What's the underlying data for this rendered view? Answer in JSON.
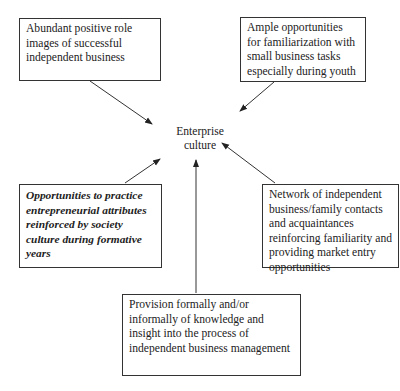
{
  "diagram": {
    "center": {
      "line1": "Enterprise",
      "line2": "culture"
    },
    "boxes": [
      {
        "id": "role-images",
        "text": "Abundant positive role images of successful independent business",
        "style": "normal"
      },
      {
        "id": "familiarization",
        "text": "Ample opportunities for familiarization with small business tasks especially during youth",
        "style": "normal"
      },
      {
        "id": "practice-opportunities",
        "text": "Opportunities to practice entrepreneurial attributes reinforced by society culture during formative years",
        "style": "bold-italic"
      },
      {
        "id": "network",
        "text": "Network of independent business/family contacts and acquaintances reinforcing familiarity and providing market entry opportunities",
        "style": "normal"
      },
      {
        "id": "knowledge-provision",
        "text": "Provision formally and/or informally of knowledge and insight into the process of independent business management",
        "style": "normal"
      }
    ],
    "arrows": [
      {
        "from": "role-images",
        "to": "center"
      },
      {
        "from": "familiarization",
        "to": "center"
      },
      {
        "from": "practice-opportunities",
        "to": "center"
      },
      {
        "from": "network",
        "to": "center"
      },
      {
        "from": "knowledge-provision",
        "to": "center"
      }
    ],
    "colors": {
      "stroke": "#333333",
      "background": "#ffffff",
      "text": "#222222"
    }
  }
}
